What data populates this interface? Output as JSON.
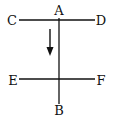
{
  "diagram": {
    "labels": {
      "A": "A",
      "B": "B",
      "C": "C",
      "D": "D",
      "E": "E",
      "F": "F"
    },
    "line_color": "#111111"
  }
}
